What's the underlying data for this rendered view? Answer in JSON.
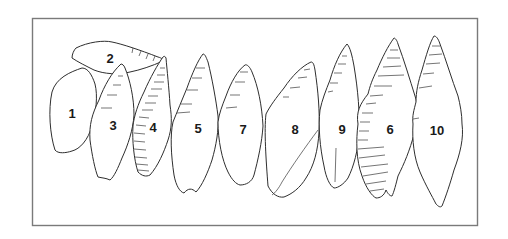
{
  "figure": {
    "frame_color": "#7a7a7a",
    "line_color": "#2e2e2e",
    "items": [
      {
        "id": "1",
        "label": "1"
      },
      {
        "id": "2",
        "label": "2"
      },
      {
        "id": "3",
        "label": "3"
      },
      {
        "id": "4",
        "label": "4"
      },
      {
        "id": "5",
        "label": "5"
      },
      {
        "id": "7",
        "label": "7"
      },
      {
        "id": "8",
        "label": "8"
      },
      {
        "id": "9",
        "label": "9"
      },
      {
        "id": "6",
        "label": "6"
      },
      {
        "id": "10",
        "label": "10"
      }
    ]
  }
}
